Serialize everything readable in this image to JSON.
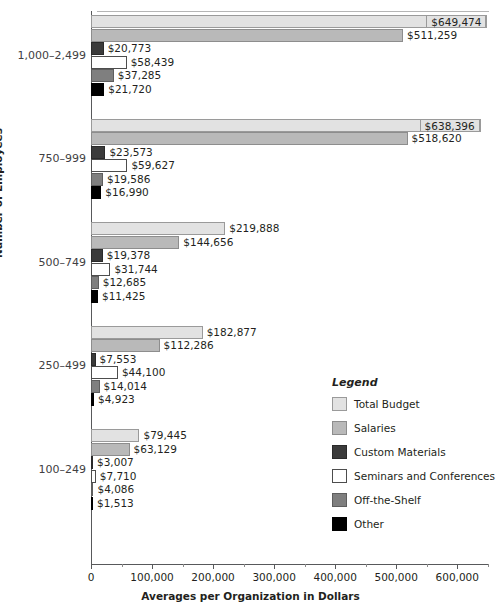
{
  "chart_data": {
    "type": "bar",
    "orientation": "horizontal",
    "title": "",
    "xlabel": "Averages per Organization in Dollars",
    "ylabel": "Number of Employees",
    "xlim": [
      0,
      652000
    ],
    "xticks": [
      0,
      100000,
      200000,
      300000,
      400000,
      500000,
      600000
    ],
    "xtick_labels": [
      "0",
      "100,000",
      "200,000",
      "300,000",
      "400,000",
      "500,000",
      "600,000"
    ],
    "grid": false,
    "legend_position": "inside-right",
    "categories": [
      "1,000–2,499",
      "750–999",
      "500–749",
      "250–499",
      "100–249"
    ],
    "series": [
      {
        "name": "Total Budget",
        "key": "total",
        "color": "#e2e2e2",
        "values": [
          649474,
          638396,
          219888,
          182877,
          79445
        ],
        "labels": [
          "$649,474",
          "$638,396",
          "$219,888",
          "$182,877",
          "$79,445"
        ]
      },
      {
        "name": "Salaries",
        "key": "salaries",
        "color": "#b9b9b9",
        "values": [
          511259,
          518620,
          144656,
          112286,
          63129
        ],
        "labels": [
          "$511,259",
          "$518,620",
          "$144,656",
          "$112,286",
          "$63,129"
        ]
      },
      {
        "name": "Custom Materials",
        "key": "custom",
        "color": "#3b3b3b",
        "values": [
          20773,
          23573,
          19378,
          7553,
          3007
        ],
        "labels": [
          "$20,773",
          "$23,573",
          "$19,378",
          "$7,553",
          "$3,007"
        ]
      },
      {
        "name": "Seminars and Conferences",
        "key": "seminars",
        "color": "#ffffff",
        "values": [
          58439,
          59627,
          31744,
          44100,
          7710
        ],
        "labels": [
          "$58,439",
          "$59,627",
          "$31,744",
          "$44,100",
          "$7,710"
        ]
      },
      {
        "name": "Off-the-Shelf",
        "key": "offshelf",
        "color": "#7f7f7f",
        "values": [
          37285,
          19586,
          12685,
          14014,
          4086
        ],
        "labels": [
          "$37,285",
          "$19,586",
          "$12,685",
          "$14,014",
          "$4,086"
        ]
      },
      {
        "name": "Other",
        "key": "other",
        "color": "#000000",
        "values": [
          21720,
          16990,
          11425,
          4923,
          1513
        ],
        "labels": [
          "$21,720",
          "$16,990",
          "$11,425",
          "$4,923",
          "$1,513"
        ]
      }
    ]
  },
  "legend": {
    "title": "Legend",
    "items": [
      {
        "label": "Total Budget",
        "key": "total"
      },
      {
        "label": "Salaries",
        "key": "salaries"
      },
      {
        "label": "Custom Materials",
        "key": "custom"
      },
      {
        "label": "Seminars and Conferences",
        "key": "seminars"
      },
      {
        "label": "Off-the-Shelf",
        "key": "offshelf"
      },
      {
        "label": "Other",
        "key": "other"
      }
    ]
  }
}
